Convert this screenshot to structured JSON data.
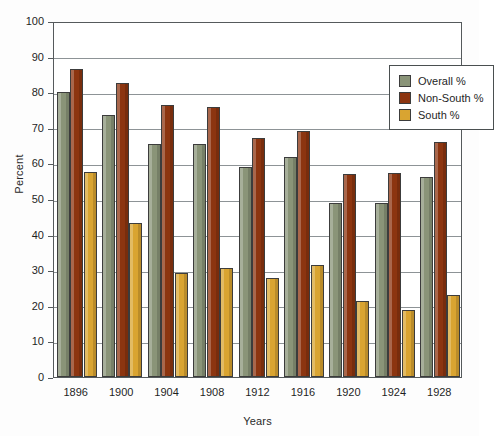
{
  "chart_data": {
    "type": "bar",
    "title": "",
    "xlabel": "Years",
    "ylabel": "Percent",
    "ylim": [
      0,
      100
    ],
    "ytick_step": 10,
    "yticks": [
      "0",
      "10",
      "20",
      "30",
      "40",
      "50",
      "60",
      "70",
      "80",
      "90",
      "100"
    ],
    "grid": true,
    "legend_position": "top-right",
    "categories": [
      "1896",
      "1900",
      "1904",
      "1908",
      "1912",
      "1916",
      "1920",
      "1924",
      "1928"
    ],
    "series": [
      {
        "name": "Overall %",
        "color": "#8a9478",
        "values": [
          80.0,
          73.7,
          65.4,
          65.5,
          59.0,
          61.9,
          49.0,
          48.8,
          56.3
        ]
      },
      {
        "name": "Non-South %",
        "color": "#8c3510",
        "values": [
          86.5,
          82.6,
          76.4,
          75.8,
          67.2,
          69.1,
          57.1,
          57.3,
          66.0
        ]
      },
      {
        "name": "South %",
        "color": "#d9a431",
        "values": [
          57.5,
          43.3,
          29.2,
          30.7,
          27.8,
          31.6,
          21.4,
          18.9,
          23.1
        ]
      }
    ]
  },
  "colors": {
    "frame": "#555a5c",
    "gridline": "#8d9396",
    "background": "#ffffff",
    "overall": "#8a9478",
    "non_south": "#8c3510",
    "south": "#d9a431"
  }
}
